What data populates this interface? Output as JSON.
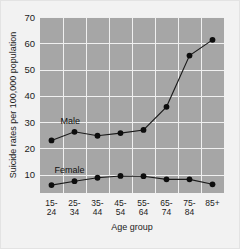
{
  "chart_data": {
    "type": "line",
    "title": "",
    "xlabel": "Age group",
    "ylabel": "Suicide rates per 100,000 population",
    "categories": [
      "15-\n24",
      "25-\n34",
      "35-\n44",
      "45-\n54",
      "55-\n64",
      "65-\n74",
      "75-\n84",
      "85+"
    ],
    "category_labels_top": [
      "15-",
      "25-",
      "35-",
      "45-",
      "55-",
      "65-",
      "75-",
      "85+"
    ],
    "category_labels_bottom": [
      "24",
      "34",
      "44",
      "54",
      "64",
      "74",
      "84",
      ""
    ],
    "yticks": [
      10,
      20,
      30,
      40,
      50,
      60,
      70
    ],
    "ytick_labels": [
      "10",
      "20",
      "30",
      "40",
      "50",
      "60",
      "70"
    ],
    "ylim": [
      3,
      70
    ],
    "grid": true,
    "legend_position": "inline-annotation",
    "series": [
      {
        "name": "Male",
        "label": "Male",
        "color": "#1a1a1a",
        "values": [
          23.0,
          26.3,
          24.8,
          25.8,
          27.0,
          35.8,
          55.3,
          61.3
        ]
      },
      {
        "name": "Female",
        "label": "Female",
        "color": "#1a1a1a",
        "values": [
          6.0,
          7.5,
          8.8,
          9.5,
          9.4,
          8.2,
          8.2,
          6.3
        ]
      }
    ]
  }
}
